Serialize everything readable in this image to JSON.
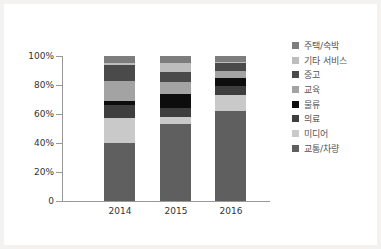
{
  "chart_data": {
    "type": "bar",
    "stacked": true,
    "title": "",
    "xlabel": "",
    "ylabel": "",
    "ylim": [
      0,
      100
    ],
    "yticks": [
      "0",
      "20%",
      "40%",
      "60%",
      "80%",
      "100%"
    ],
    "categories": [
      "2014",
      "2015",
      "2016"
    ],
    "legend_position": "right",
    "grid": false,
    "series": [
      {
        "name": "교통/차량",
        "color": "#5f5f5f",
        "values": [
          40,
          53,
          62
        ]
      },
      {
        "name": "미디어",
        "color": "#c9c9c9",
        "values": [
          17,
          5,
          11
        ]
      },
      {
        "name": "의료",
        "color": "#3e3e3e",
        "values": [
          9,
          6,
          6
        ]
      },
      {
        "name": "물류",
        "color": "#0d0d0d",
        "values": [
          3,
          10,
          6
        ]
      },
      {
        "name": "교육",
        "color": "#a3a3a3",
        "values": [
          14,
          8,
          5
        ]
      },
      {
        "name": "중고",
        "color": "#4a4a4a",
        "values": [
          11,
          7,
          5
        ]
      },
      {
        "name": "기타 서비스",
        "color": "#bdbdbd",
        "values": [
          1,
          6,
          1
        ]
      },
      {
        "name": "주택/숙박",
        "color": "#7d7d7d",
        "values": [
          5,
          5,
          4
        ]
      }
    ]
  },
  "legend": [
    {
      "label": "주택/숙박",
      "color": "#7d7d7d"
    },
    {
      "label": "기타 서비스",
      "color": "#bdbdbd"
    },
    {
      "label": "중고",
      "color": "#4a4a4a"
    },
    {
      "label": "교육",
      "color": "#a3a3a3"
    },
    {
      "label": "물류",
      "color": "#0d0d0d"
    },
    {
      "label": "의료",
      "color": "#3e3e3e"
    },
    {
      "label": "미디어",
      "color": "#c9c9c9"
    },
    {
      "label": "교통/차량",
      "color": "#5f5f5f"
    }
  ]
}
